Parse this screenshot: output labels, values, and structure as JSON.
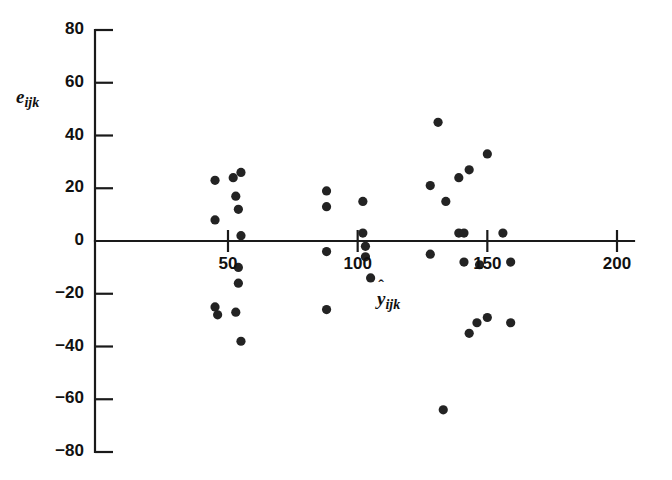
{
  "chart_data": {
    "type": "scatter",
    "title": "",
    "xlabel": "ŷ_ijk",
    "xlabel_base": "y",
    "xlabel_sub": "ijk",
    "xlabel_hat": "ˆ",
    "ylabel": "e_ijk",
    "ylabel_base": "e",
    "ylabel_sub": "ijk",
    "xlim": [
      20,
      215
    ],
    "ylim": [
      -80,
      80
    ],
    "xticks": [
      50,
      100,
      150,
      200
    ],
    "xtick_labels": [
      "50",
      "100",
      "150",
      "200"
    ],
    "yticks": [
      80,
      60,
      40,
      20,
      0,
      -20,
      -40,
      -60,
      -80
    ],
    "ytick_labels": [
      "80",
      "60",
      "40",
      "20",
      "0",
      "−20",
      "−40",
      "−60",
      "−80"
    ],
    "grid": false,
    "legend": false,
    "marker": "filled-circle",
    "marker_color": "#232323",
    "axis_color": "#1a1a1a",
    "background": "#ffffff",
    "zero_line": true,
    "points": [
      {
        "x": 45,
        "y": 23
      },
      {
        "x": 45,
        "y": 8
      },
      {
        "x": 45,
        "y": -25
      },
      {
        "x": 52,
        "y": 24
      },
      {
        "x": 55,
        "y": 26
      },
      {
        "x": 53,
        "y": 17
      },
      {
        "x": 54,
        "y": 12
      },
      {
        "x": 55,
        "y": 2
      },
      {
        "x": 54,
        "y": -10
      },
      {
        "x": 54,
        "y": -16
      },
      {
        "x": 53,
        "y": -27
      },
      {
        "x": 46,
        "y": -28
      },
      {
        "x": 55,
        "y": -38
      },
      {
        "x": 88,
        "y": 19
      },
      {
        "x": 88,
        "y": 13
      },
      {
        "x": 88,
        "y": -4
      },
      {
        "x": 88,
        "y": -26
      },
      {
        "x": 102,
        "y": 15
      },
      {
        "x": 102,
        "y": 3
      },
      {
        "x": 103,
        "y": -2
      },
      {
        "x": 103,
        "y": -6
      },
      {
        "x": 105,
        "y": -14
      },
      {
        "x": 131,
        "y": 45
      },
      {
        "x": 128,
        "y": 21
      },
      {
        "x": 134,
        "y": 15
      },
      {
        "x": 143,
        "y": 27
      },
      {
        "x": 139,
        "y": 24
      },
      {
        "x": 150,
        "y": 33
      },
      {
        "x": 139,
        "y": 3
      },
      {
        "x": 141,
        "y": 3
      },
      {
        "x": 156,
        "y": 3
      },
      {
        "x": 128,
        "y": -5
      },
      {
        "x": 141,
        "y": -8
      },
      {
        "x": 147,
        "y": -9
      },
      {
        "x": 159,
        "y": -8
      },
      {
        "x": 146,
        "y": -31
      },
      {
        "x": 150,
        "y": -29
      },
      {
        "x": 143,
        "y": -35
      },
      {
        "x": 159,
        "y": -31
      },
      {
        "x": 133,
        "y": -64
      }
    ]
  },
  "caption": {
    "partial_text": ""
  }
}
